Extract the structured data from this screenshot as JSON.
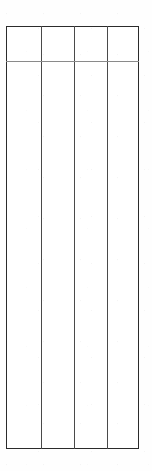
{
  "document": {
    "type": "table",
    "description": "empty-ruled-table",
    "background_color": "#fefefe"
  },
  "table": {
    "column_count": 4,
    "header_row_count": 1,
    "body_row_count": 1,
    "border_color": "#2b2b2b",
    "column_rule_color": "#4a4a4a",
    "header_rule_color": "#8a8a8a",
    "cell_background": "#ffffff",
    "columns": [
      {
        "id": "col-1",
        "header": "",
        "width_px": 35
      },
      {
        "id": "col-2",
        "header": "",
        "width_px": 34
      },
      {
        "id": "col-3",
        "header": "",
        "width_px": 33
      },
      {
        "id": "col-4",
        "header": "",
        "width_px": 31
      }
    ],
    "header": [
      "",
      "",
      "",
      ""
    ],
    "rows": [
      [
        "",
        "",
        "",
        ""
      ]
    ]
  }
}
